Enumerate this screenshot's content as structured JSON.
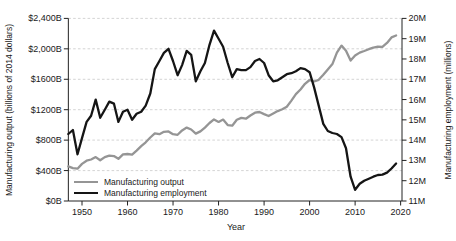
{
  "chart_data": {
    "type": "line",
    "title": "",
    "grid": "horizontal-dashed",
    "legend_position": "inside-bottom-left",
    "x": [
      1947,
      1948,
      1949,
      1950,
      1951,
      1952,
      1953,
      1954,
      1955,
      1956,
      1957,
      1958,
      1959,
      1960,
      1961,
      1962,
      1963,
      1964,
      1965,
      1966,
      1967,
      1968,
      1969,
      1970,
      1971,
      1972,
      1973,
      1974,
      1975,
      1976,
      1977,
      1978,
      1979,
      1980,
      1981,
      1982,
      1983,
      1984,
      1985,
      1986,
      1987,
      1988,
      1989,
      1990,
      1991,
      1992,
      1993,
      1994,
      1995,
      1996,
      1997,
      1998,
      1999,
      2000,
      2001,
      2002,
      2003,
      2004,
      2005,
      2006,
      2007,
      2008,
      2009,
      2010,
      2011,
      2012,
      2013,
      2014,
      2015,
      2016,
      2017,
      2018,
      2019
    ],
    "series": [
      {
        "name": "Manufacturing output",
        "axis": "left",
        "color": "#959595",
        "values": [
          455,
          432,
          425,
          488,
          530,
          545,
          577,
          535,
          577,
          597,
          590,
          555,
          612,
          618,
          608,
          662,
          722,
          772,
          835,
          888,
          878,
          910,
          915,
          878,
          870,
          928,
          965,
          940,
          886,
          915,
          965,
          1025,
          1072,
          1040,
          1070,
          998,
          990,
          1068,
          1092,
          1082,
          1124,
          1160,
          1170,
          1142,
          1117,
          1150,
          1182,
          1205,
          1240,
          1320,
          1405,
          1465,
          1540,
          1590,
          1570,
          1593,
          1660,
          1730,
          1800,
          1950,
          2042,
          1975,
          1845,
          1912,
          1950,
          1972,
          1995,
          2016,
          2030,
          2026,
          2078,
          2150,
          2175
        ]
      },
      {
        "name": "Manufacturing employment",
        "axis": "right",
        "color": "#151515",
        "values": [
          14.3,
          14.5,
          13.3,
          14.1,
          14.9,
          15.2,
          16.0,
          15.1,
          15.5,
          15.9,
          15.8,
          14.9,
          15.4,
          15.5,
          15.0,
          15.3,
          15.4,
          15.7,
          16.3,
          17.5,
          17.9,
          18.3,
          18.5,
          17.9,
          17.2,
          17.7,
          18.4,
          18.2,
          16.9,
          17.4,
          17.8,
          18.7,
          19.4,
          19.0,
          18.6,
          17.8,
          17.1,
          17.5,
          17.45,
          17.45,
          17.6,
          17.9,
          18.0,
          17.8,
          17.2,
          16.9,
          16.95,
          17.1,
          17.25,
          17.3,
          17.4,
          17.55,
          17.5,
          17.35,
          16.6,
          15.7,
          14.8,
          14.45,
          14.35,
          14.3,
          14.15,
          13.6,
          12.2,
          11.55,
          11.85,
          12.0,
          12.1,
          12.2,
          12.28,
          12.3,
          12.4,
          12.6,
          12.85
        ]
      }
    ],
    "left_axis": {
      "label": "Manufacturing output (billions of 2014 dollars)",
      "range": [
        0,
        2400
      ],
      "tick_values": [
        0,
        400,
        800,
        1200,
        1600,
        2000,
        2400
      ],
      "tick_labels": [
        "$0B",
        "$400B",
        "$800B",
        "$1200B",
        "$1600B",
        "$2,000B",
        "$2,400B"
      ]
    },
    "right_axis": {
      "label": "Manufacturing employment (millions)",
      "range": [
        11,
        20
      ],
      "tick_values": [
        11,
        12,
        13,
        14,
        15,
        16,
        17,
        18,
        19,
        20
      ],
      "tick_labels": [
        "11M",
        "12M",
        "13M",
        "14M",
        "15M",
        "16M",
        "17M",
        "18M",
        "19M",
        "20M"
      ]
    },
    "x_axis": {
      "label": "Year",
      "range": [
        1947,
        2020.3
      ],
      "tick_values": [
        1950,
        1960,
        1970,
        1980,
        1990,
        2000,
        2010,
        2020
      ],
      "tick_labels": [
        "1950",
        "1960",
        "1970",
        "1980",
        "1990",
        "2000",
        "2010",
        "2020"
      ]
    },
    "colors": {
      "axis": "#222222",
      "grid": "#cfcfcf",
      "text": "#1a1a1a"
    }
  }
}
